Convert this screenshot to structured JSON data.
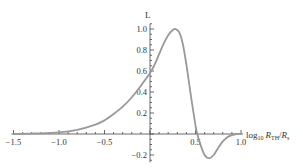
{
  "chart_data": {
    "type": "line",
    "title": "",
    "xlabel": "log10 R_TH/R_s",
    "ylabel": "L",
    "xlim": [
      -1.5,
      1.0
    ],
    "ylim": [
      -0.25,
      1.05
    ],
    "grid": false,
    "legend": null,
    "x_ticks": [
      "-1.5",
      "-1.0",
      "-0.5",
      "0.5",
      "1.0"
    ],
    "y_ticks": [
      "1.0",
      "0.8",
      "0.6",
      "0.4",
      "0.2",
      "-0.2"
    ],
    "series": [
      {
        "name": "L",
        "color": "#999999",
        "x": [
          -1.5,
          -1.25,
          -1.0,
          -0.8,
          -0.6,
          -0.5,
          -0.4,
          -0.3,
          -0.2,
          -0.1,
          0.0,
          0.05,
          0.1,
          0.15,
          0.2,
          0.25,
          0.28,
          0.32,
          0.36,
          0.4,
          0.45,
          0.5,
          0.52,
          0.55,
          0.6,
          0.65,
          0.7,
          0.75,
          0.8,
          0.85,
          0.9,
          0.95,
          1.0
        ],
        "y": [
          0.0,
          0.005,
          0.015,
          0.04,
          0.09,
          0.13,
          0.19,
          0.26,
          0.35,
          0.46,
          0.58,
          0.66,
          0.76,
          0.86,
          0.94,
          0.99,
          1.0,
          0.97,
          0.86,
          0.66,
          0.36,
          0.08,
          0.0,
          -0.09,
          -0.2,
          -0.23,
          -0.2,
          -0.13,
          -0.07,
          -0.03,
          -0.01,
          0.0,
          0.0
        ]
      }
    ]
  },
  "labels": {
    "y_axis_title": "L",
    "x_axis_title_prefix": "log",
    "x_axis_title_sub": "10",
    "x_axis_title_R1": "R",
    "x_axis_title_R1_sub": "TH",
    "x_axis_title_sep": "/",
    "x_axis_title_R2": "R",
    "x_axis_title_R2_sub": "s"
  }
}
